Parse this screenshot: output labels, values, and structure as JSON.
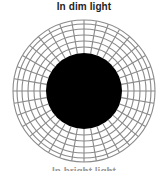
{
  "figure": {
    "title": "In dim light",
    "bottom_caption_partial": "In bright light",
    "pupil": {
      "center": [
        84,
        91
      ],
      "radius": 38,
      "fill": "#000000"
    },
    "iris_grid": {
      "center": [
        84,
        91
      ],
      "outer_radius": 71,
      "ring_radii": [
        44,
        50,
        56,
        62,
        67,
        71
      ],
      "spoke_count": 36,
      "line_color": "#8a8a8a"
    }
  }
}
